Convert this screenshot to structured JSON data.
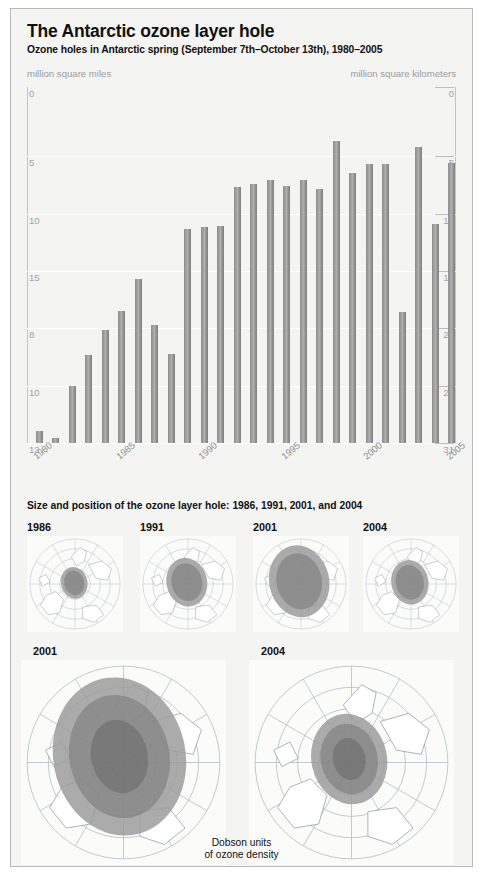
{
  "header": {
    "title": "The Antarctic ozone layer hole",
    "subtitle": "Ozone holes in Antarctic spring (September 7th–October 13th), 1980–2005"
  },
  "chart_units": {
    "left": "million square miles",
    "right": "million square kilometers"
  },
  "axis_left_ticks": [
    "12",
    "10",
    "8",
    "15",
    "10",
    "5",
    "0"
  ],
  "axis_right_ticks": [
    "31",
    "25",
    "20",
    "15",
    "10",
    "5",
    "0"
  ],
  "maps_section": {
    "heading": "Size and position of the ozone layer hole: 1986, 1991, 2001, and 2004",
    "small": [
      {
        "year": "1986",
        "hole_scale": 0.3
      },
      {
        "year": "1991",
        "hole_scale": 0.46
      },
      {
        "year": "2001",
        "hole_scale": 0.68
      },
      {
        "year": "2004",
        "hole_scale": 0.42
      }
    ],
    "large": [
      {
        "year": "2001",
        "hole_scale": 0.7
      },
      {
        "year": "2004",
        "hole_scale": 0.4
      }
    ],
    "legend_line1": "Dobson units",
    "legend_line2": "of ozone density"
  },
  "colors": {
    "bar": "#9a9a9a",
    "panel_bg": "#f4f4f2",
    "panel_border": "#b9b9b9",
    "grid": "#ffffff",
    "tick_text": "#a2a2a2",
    "unit_text": "#9d9d9d",
    "hole_outer": "#9c9c9c",
    "hole_inner": "#777777",
    "map_line": "#b4bcc6"
  },
  "chart_data": {
    "type": "bar",
    "title": "Ozone holes in Antarctic spring (September 7th–October 13th), 1980–2005",
    "xlabel": "",
    "ylabel": "million square kilometers",
    "ylabel_secondary": "million square miles",
    "ylim": [
      0,
      31
    ],
    "grid": true,
    "legend": "none",
    "tick_values_right": [
      0,
      5,
      10,
      15,
      20,
      25,
      31
    ],
    "tick_values_left": [
      0,
      5,
      10,
      15,
      8,
      10,
      12
    ],
    "xtick_labels": [
      "1980",
      "1985",
      "1990",
      "1995",
      "2000",
      "2005"
    ],
    "categories": [
      "1980",
      "1981",
      "1982",
      "1983",
      "1984",
      "1985",
      "1986",
      "1987",
      "1988",
      "1989",
      "1990",
      "1991",
      "1992",
      "1993",
      "1994",
      "1995",
      "1996",
      "1997",
      "1998",
      "1999",
      "2000",
      "2001",
      "2002",
      "2003",
      "2004",
      "2005"
    ],
    "values": [
      1.1,
      0.5,
      5.0,
      7.7,
      9.9,
      11.5,
      14.3,
      10.3,
      7.8,
      18.7,
      18.8,
      18.9,
      22.3,
      22.6,
      22.9,
      22.4,
      22.9,
      22.1,
      26.3,
      23.5,
      24.3,
      24.3,
      11.4,
      25.8,
      19.1,
      24.4
    ]
  }
}
